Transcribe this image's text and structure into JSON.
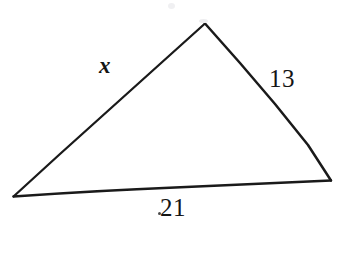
{
  "figure": {
    "type": "triangle-diagram",
    "background_color": "#ffffff",
    "stroke_color": "#1a1a1a",
    "stroke_width": 2.2,
    "canvas": {
      "width": 347,
      "height": 274
    }
  },
  "vertices": {
    "apex": {
      "name": "top-vertex",
      "x": 205,
      "y": 23
    },
    "left": {
      "name": "bottom-left-vertex",
      "x": 13,
      "y": 197
    },
    "right": {
      "name": "bottom-right-vertex",
      "x": 331,
      "y": 181
    }
  },
  "sides": [
    {
      "id": "left-side",
      "label": "x",
      "label_style": "italic",
      "from": "left",
      "to": "apex",
      "label_x": 99,
      "label_y": 54
    },
    {
      "id": "right-side",
      "label": "13",
      "label_style": "normal",
      "from": "apex",
      "to": "right",
      "label_x": 269,
      "label_y": 66
    },
    {
      "id": "bottom-side",
      "label": "21",
      "label_style": "normal",
      "from": "left",
      "to": "right",
      "label_x": 160,
      "label_y": 195
    }
  ],
  "labels": {
    "unknown_side": "x",
    "right_side_length": "13",
    "bottom_side_length": "21"
  }
}
